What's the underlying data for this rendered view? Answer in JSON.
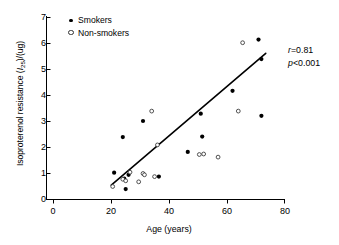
{
  "chart_data": {
    "type": "scatter",
    "title": "",
    "xlabel": "Age (years)",
    "ylabel_parts": {
      "pre": "Isoproterenol resistance (",
      "italic": "I",
      "subscript": "25",
      "post": ")/(ug)"
    },
    "ylabel": "Isoproterenol resistance (I25)/(ug)",
    "xlim": [
      0,
      80
    ],
    "ylim": [
      0,
      7
    ],
    "xticks": [
      0,
      20,
      40,
      60,
      80
    ],
    "yticks": [
      0,
      1,
      2,
      3,
      4,
      5,
      6,
      7
    ],
    "xtick_labels": [
      "0",
      "20",
      "40",
      "60",
      "80"
    ],
    "ytick_labels": [
      "0",
      "1",
      "2",
      "3",
      "4",
      "5",
      "6",
      "7"
    ],
    "grid": false,
    "legend_position": "top-left",
    "series": [
      {
        "name": "Smokers",
        "marker": "filled-circle",
        "color": "#000000",
        "points": [
          [
            21.0,
            1.03
          ],
          [
            24.0,
            2.4
          ],
          [
            24.5,
            0.8
          ],
          [
            25.0,
            0.4
          ],
          [
            26.0,
            0.95
          ],
          [
            31.0,
            3.02
          ],
          [
            36.5,
            0.88
          ],
          [
            46.5,
            1.83
          ],
          [
            51.0,
            3.3
          ],
          [
            51.5,
            2.42
          ],
          [
            62.0,
            4.18
          ],
          [
            71.0,
            6.15
          ],
          [
            72.0,
            5.4
          ],
          [
            72.0,
            3.22
          ]
        ]
      },
      {
        "name": "Non-smokers",
        "marker": "open-circle",
        "color": "#333333",
        "points": [
          [
            20.5,
            0.5
          ],
          [
            24.0,
            0.78
          ],
          [
            25.0,
            0.72
          ],
          [
            26.5,
            1.05
          ],
          [
            29.5,
            0.68
          ],
          [
            31.0,
            1.0
          ],
          [
            31.5,
            0.95
          ],
          [
            34.0,
            3.4
          ],
          [
            35.0,
            0.88
          ],
          [
            36.0,
            2.1
          ],
          [
            50.5,
            1.73
          ],
          [
            52.0,
            1.75
          ],
          [
            57.0,
            1.63
          ],
          [
            64.0,
            3.4
          ],
          [
            65.5,
            6.03
          ]
        ]
      }
    ],
    "regression_line": {
      "x_start": 20.0,
      "y_start": 0.55,
      "x_end": 73.5,
      "y_end": 5.62
    },
    "annotations": [
      {
        "italic": "r",
        "text": "=0.81"
      },
      {
        "italic": "p",
        "text": "<0.001"
      }
    ]
  },
  "legend": {
    "items": [
      {
        "label": "Smokers"
      },
      {
        "label": "Non-smokers"
      }
    ]
  },
  "annotation_text": {
    "r_italic": "r",
    "r_value": "=0.81",
    "p_italic": "p",
    "p_value": "<0.001"
  }
}
